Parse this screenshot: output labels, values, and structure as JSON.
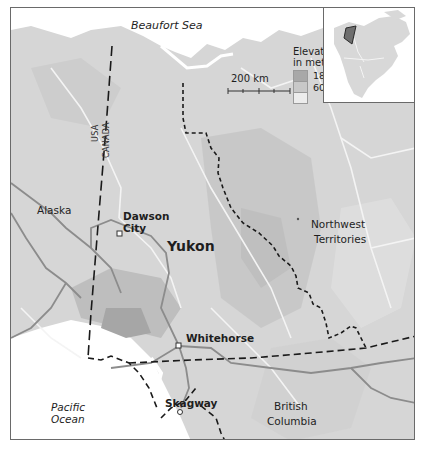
{
  "map": {
    "title_region": "Yukon",
    "labels": {
      "beaufort_sea": "Beaufort Sea",
      "alaska": "Alaska",
      "yukon": "Yukon",
      "dawson_city_line1": "Dawson",
      "dawson_city_line2": "City",
      "northwest_line1": "Northwest",
      "northwest_line2": "Territories",
      "whitehorse": "Whitehorse",
      "skagway": "Skagway",
      "british_line1": "British",
      "british_line2": "Columbia",
      "pacific_line1": "Pacific",
      "pacific_line2": "Ocean",
      "usa": "USA",
      "canada": "CANADA"
    },
    "legend": {
      "title_line1": "Elevation",
      "title_line2": "in metres",
      "levels": [
        {
          "label": "1800",
          "color": "#a8a8a8"
        },
        {
          "label": "600",
          "color": "#c8c8c8"
        },
        {
          "label": "",
          "color": "#e6e6e6"
        }
      ]
    },
    "scale_bar": {
      "label": "200 km"
    },
    "colors": {
      "ocean": "#ffffff",
      "land_low": "#dcdcdc",
      "land_mid": "#cdcdcd",
      "land_high": "#b4b4b4",
      "rivers": "#f2f2f2",
      "roads": "#8a8a8a",
      "borders": "#1a1a1a",
      "inset_highlight": "#6e6e6e"
    }
  }
}
